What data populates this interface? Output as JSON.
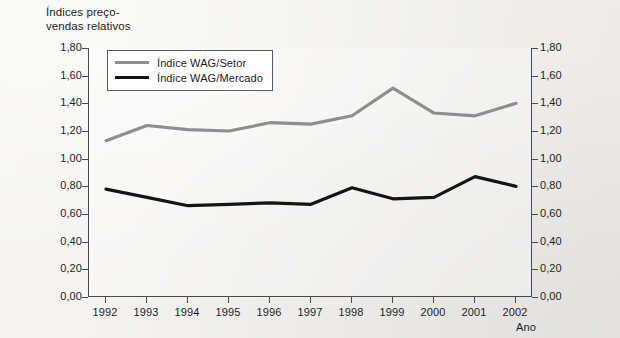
{
  "figure": {
    "axis_title": "Índices preço-\nvendas relativos",
    "xaxis_label": "Ano"
  },
  "legend": {
    "entries": [
      {
        "label": "Índice WAG/Setor",
        "color": "#8e8e8e",
        "key": "setor"
      },
      {
        "label": "Índice WAG/Mercado",
        "color": "#141414",
        "key": "mercado"
      }
    ]
  },
  "chart_data": {
    "type": "line",
    "xlabel": "Ano",
    "ylabel": "Índices preço-vendas relativos",
    "categories": [
      "1992",
      "1993",
      "1994",
      "1995",
      "1996",
      "1997",
      "1998",
      "1999",
      "2000",
      "2001",
      "2002"
    ],
    "x": [
      1992,
      1993,
      1994,
      1995,
      1996,
      1997,
      1998,
      1999,
      2000,
      2001,
      2002
    ],
    "series": [
      {
        "name": "Índice WAG/Setor",
        "color": "#8e8e8e",
        "values": [
          1.13,
          1.24,
          1.21,
          1.2,
          1.26,
          1.25,
          1.31,
          1.51,
          1.33,
          1.31,
          1.4
        ]
      },
      {
        "name": "Índice WAG/Mercado",
        "color": "#141414",
        "values": [
          0.78,
          0.72,
          0.66,
          0.67,
          0.68,
          0.67,
          0.79,
          0.71,
          0.72,
          0.87,
          0.8
        ]
      }
    ],
    "ylim": [
      0.0,
      1.8
    ],
    "ytick_values": [
      0.0,
      0.2,
      0.4,
      0.6,
      0.8,
      1.0,
      1.2,
      1.4,
      1.6,
      1.8
    ],
    "ytick_labels_left": [
      "0,00",
      "0,20",
      "0,40",
      "0,60",
      "0,80",
      "1,00",
      "1,20",
      "1,40",
      "1,60",
      "1,80"
    ],
    "ytick_labels_right": [
      "0,00",
      "0,20",
      "0,40",
      "0,60",
      "0,80",
      "1,00",
      "1,20",
      "1,40",
      "1,60",
      "1,80"
    ],
    "grid": false,
    "legend_position": "top-left-inside",
    "dual_y_axis": true
  }
}
